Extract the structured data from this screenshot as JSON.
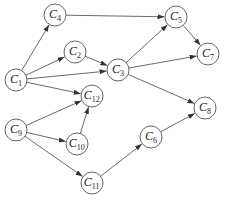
{
  "diagram": {
    "type": "directed-graph",
    "node_radius": 11,
    "stroke_color": "#444444",
    "nodes": [
      {
        "id": "C1",
        "base": "C",
        "sub": "1",
        "x": 16,
        "y": 80
      },
      {
        "id": "C2",
        "base": "C",
        "sub": "2",
        "x": 75,
        "y": 52
      },
      {
        "id": "C3",
        "base": "C",
        "sub": "3",
        "x": 118,
        "y": 70
      },
      {
        "id": "C4",
        "base": "C",
        "sub": "4",
        "x": 55,
        "y": 15
      },
      {
        "id": "C5",
        "base": "C",
        "sub": "5",
        "x": 176,
        "y": 17
      },
      {
        "id": "C6",
        "base": "C",
        "sub": "6",
        "x": 151,
        "y": 137
      },
      {
        "id": "C7",
        "base": "C",
        "sub": "7",
        "x": 208,
        "y": 54
      },
      {
        "id": "C8",
        "base": "C",
        "sub": "8",
        "x": 205,
        "y": 108
      },
      {
        "id": "C9",
        "base": "C",
        "sub": "9",
        "x": 16,
        "y": 130
      },
      {
        "id": "C10",
        "base": "C",
        "sub": "10",
        "x": 77,
        "y": 144
      },
      {
        "id": "C11",
        "base": "C",
        "sub": "11",
        "x": 92,
        "y": 183
      },
      {
        "id": "C12",
        "base": "C",
        "sub": "12",
        "x": 92,
        "y": 96
      }
    ],
    "edges": [
      {
        "from": "C1",
        "to": "C4"
      },
      {
        "from": "C1",
        "to": "C2"
      },
      {
        "from": "C1",
        "to": "C3"
      },
      {
        "from": "C1",
        "to": "C12"
      },
      {
        "from": "C4",
        "to": "C5"
      },
      {
        "from": "C2",
        "to": "C3"
      },
      {
        "from": "C3",
        "to": "C5"
      },
      {
        "from": "C3",
        "to": "C7"
      },
      {
        "from": "C3",
        "to": "C8"
      },
      {
        "from": "C5",
        "to": "C7"
      },
      {
        "from": "C9",
        "to": "C12"
      },
      {
        "from": "C9",
        "to": "C10"
      },
      {
        "from": "C10",
        "to": "C12"
      },
      {
        "from": "C9",
        "to": "C11"
      },
      {
        "from": "C11",
        "to": "C6"
      },
      {
        "from": "C6",
        "to": "C8"
      }
    ]
  }
}
